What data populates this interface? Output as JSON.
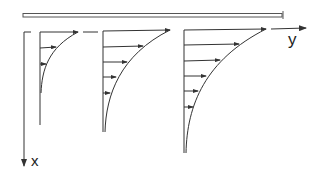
{
  "diagram": {
    "type": "boundary-layer velocity profiles along a flat plate",
    "labels": {
      "x_axis": "x",
      "y_axis": "y"
    },
    "plate": {
      "x1": 22,
      "x2": 283,
      "y": 15
    },
    "profiles": [
      {
        "name": "profile-1",
        "wall_x": 40,
        "top_y": 32,
        "bottom_y": 125,
        "tip_x": 78,
        "arrow_rows": [
          32,
          47,
          64
        ]
      },
      {
        "name": "profile-2",
        "wall_x": 103,
        "top_y": 32,
        "bottom_y": 132,
        "tip_x": 170,
        "arrow_rows": [
          32,
          47,
          62,
          77,
          93
        ]
      },
      {
        "name": "profile-3",
        "wall_x": 184,
        "top_y": 30,
        "bottom_y": 153,
        "tip_x": 266,
        "arrow_rows": [
          30,
          45,
          61,
          76,
          91,
          107
        ]
      }
    ],
    "colors": {
      "line": "#333333",
      "background": "#ffffff"
    }
  }
}
